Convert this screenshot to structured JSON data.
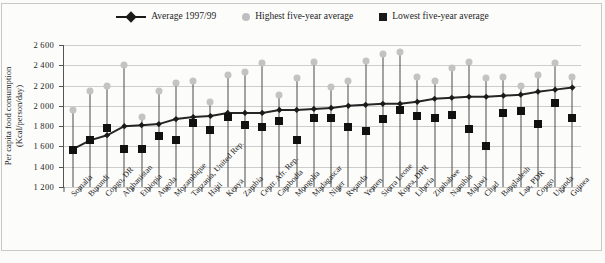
{
  "legend": {
    "items": [
      {
        "key": "average",
        "label": "Average 1997/99",
        "marker": "line-diamond-marker",
        "color": "#1a1a1a"
      },
      {
        "key": "highest",
        "label": "Highest five-year average",
        "marker": "circle-marker",
        "color": "#bfbfbf"
      },
      {
        "key": "lowest",
        "label": "Lowest five-year average",
        "marker": "square-marker",
        "color": "#1a1a1a"
      }
    ]
  },
  "chart_data": {
    "type": "line",
    "title": "",
    "xlabel": "",
    "ylabel": "Per capita food consumption (Kcal/person/day)",
    "ylabel_lines": [
      "Per capita food consumption",
      "(Kcal/person/day)"
    ],
    "ylim": [
      1200,
      2600
    ],
    "yticks": [
      1200,
      1400,
      1600,
      1800,
      2000,
      2200,
      2400,
      2600
    ],
    "grid": true,
    "legend_position": "top-center",
    "categories": [
      "Somalia",
      "Burundi",
      "Congo, DR",
      "Afghanistan",
      "Ethiopia",
      "Angola",
      "Mozambique",
      "Tanzania, United Rep.",
      "Haiti",
      "Kenya",
      "Zambia",
      "Centr. Afr. Rep.",
      "Cambodia",
      "Mongolia",
      "Madagascar",
      "Niger",
      "Rwanda",
      "Yemen",
      "Sierra Leone",
      "Korea, DPR",
      "Liberia",
      "Zimbabwe",
      "Namibia",
      "Malawi",
      "Chad",
      "Bangladesh",
      "Lao, PDR",
      "Congo",
      "Uganda",
      "Guinea"
    ],
    "series": [
      {
        "name": "Average 1997/99",
        "values": [
          1570,
          1660,
          1710,
          1800,
          1810,
          1820,
          1870,
          1890,
          1900,
          1930,
          1930,
          1930,
          1960,
          1960,
          1970,
          1980,
          2000,
          2010,
          2020,
          2020,
          2040,
          2070,
          2080,
          2090,
          2090,
          2100,
          2110,
          2140,
          2160,
          2180
        ]
      },
      {
        "name": "Highest five-year average",
        "values": [
          1960,
          2150,
          2200,
          2400,
          1890,
          2150,
          2230,
          2250,
          2040,
          2300,
          2330,
          2420,
          2110,
          2270,
          2430,
          2190,
          2250,
          2440,
          2510,
          2530,
          2280,
          2250,
          2370,
          2430,
          2270,
          2280,
          2200,
          2300,
          2420,
          2280
        ]
      },
      {
        "name": "Lowest five-year average",
        "values": [
          1560,
          1660,
          1780,
          1570,
          1570,
          1700,
          1660,
          1830,
          1760,
          1890,
          1810,
          1790,
          1850,
          1660,
          1880,
          1880,
          1790,
          1750,
          1870,
          1960,
          1900,
          1880,
          1910,
          1770,
          1600,
          1930,
          1950,
          1820,
          2030,
          1880
        ]
      }
    ]
  }
}
